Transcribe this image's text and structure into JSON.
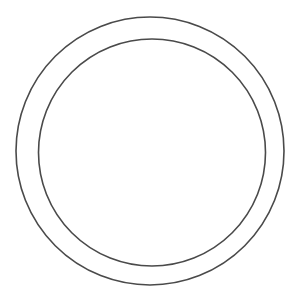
{
  "diagram": {
    "background": "#ffffff",
    "stroke_color": "#4a4a4a",
    "shapes": [
      {
        "id": "outer-ring",
        "type": "circle",
        "cx": 150,
        "cy": 151,
        "r": 134,
        "stroke_width": 1.6
      },
      {
        "id": "inner-ring",
        "type": "circle",
        "cx": 152,
        "cy": 152.5,
        "r": 113.5,
        "stroke_width": 1.6
      }
    ]
  }
}
